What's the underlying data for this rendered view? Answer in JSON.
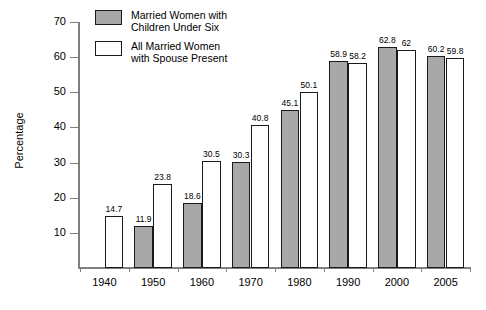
{
  "chart_data": {
    "type": "bar",
    "title": "",
    "xlabel": "",
    "ylabel": "Percentage",
    "ylim": [
      0,
      70
    ],
    "ytick_labels": [
      "70",
      "60",
      "50",
      "40",
      "30",
      "20",
      "10"
    ],
    "ytick_values": [
      70,
      60,
      50,
      40,
      30,
      20,
      10
    ],
    "grid": false,
    "legend_position": "top-left",
    "categories": [
      "1940",
      "1950",
      "1960",
      "1970",
      "1980",
      "1990",
      "2000",
      "2005"
    ],
    "series": [
      {
        "name": "Married Women with Children Under Six",
        "color": "#a8a8a8",
        "values": [
          null,
          11.9,
          18.6,
          30.3,
          45.1,
          58.9,
          62.8,
          60.2
        ],
        "labels": [
          "",
          "11.9",
          "18.6",
          "30.3",
          "45.1",
          "58.9",
          "62.8",
          "60.2"
        ]
      },
      {
        "name": "All Married Women with Spouse Present",
        "color": "#ffffff",
        "values": [
          14.7,
          23.8,
          30.5,
          40.8,
          50.1,
          58.2,
          62.0,
          59.8
        ],
        "labels": [
          "14.7",
          "23.8",
          "30.5",
          "40.8",
          "50.1",
          "58.2",
          "62",
          "59.8"
        ]
      }
    ]
  },
  "legend": {
    "items": [
      {
        "swatch": "gray",
        "line1": "Married Women with",
        "line2": "Children Under Six"
      },
      {
        "swatch": "white",
        "line1": "All Married Women",
        "line2": "with Spouse Present"
      }
    ]
  }
}
